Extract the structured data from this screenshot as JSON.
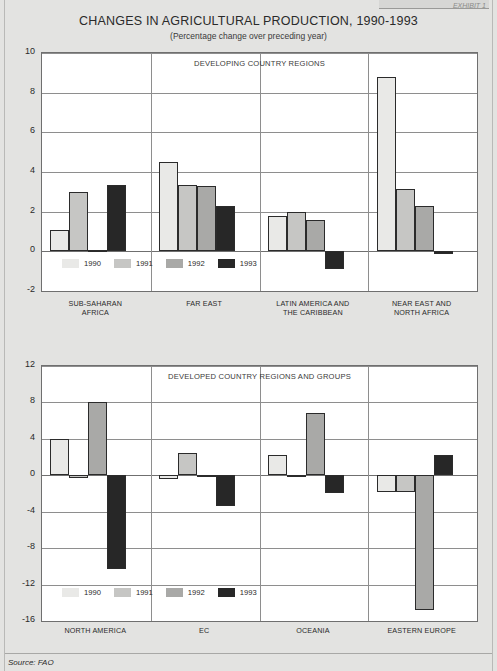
{
  "page": {
    "exhibit_tag": "EXHIBIT 1",
    "title": "CHANGES IN AGRICULTURAL PRODUCTION, 1990-1993",
    "subtitle": "(Percentage change over preceding year)",
    "source": "Source: FAO",
    "background_color": "#e3e3e1",
    "plot_background_color": "#ffffff"
  },
  "series_colors": {
    "1990": "#e9e9e7",
    "1991": "#c6c6c4",
    "1992": "#a9a9a7",
    "1993": "#272727"
  },
  "legend": {
    "items": [
      {
        "label": "1990",
        "color": "#e9e9e7"
      },
      {
        "label": "1991",
        "color": "#c6c6c4"
      },
      {
        "label": "1992",
        "color": "#a9a9a7"
      },
      {
        "label": "1993",
        "color": "#272727"
      }
    ]
  },
  "chart_data": [
    {
      "type": "bar",
      "title": "CHANGES IN AGRICULTURAL PRODUCTION, 1990-1993",
      "subtitle": "(Percentage change over preceding year)",
      "panel_caption": "DEVELOPING COUNTRY REGIONS",
      "xlabel": "",
      "ylabel": "",
      "ylim": [
        -2,
        10
      ],
      "yticks": [
        10,
        8,
        6,
        4,
        2,
        0,
        -2
      ],
      "ytick_labels": [
        "10",
        "8",
        "6",
        "4",
        "2",
        "0",
        "-2"
      ],
      "grid": true,
      "legend_position": "inside-bottom-left",
      "categories": [
        "SUB-SAHARAN AFRICA",
        "FAR EAST",
        "LATIN AMERICA AND THE CARIBBEAN",
        "NEAR EAST AND NORTH AFRICA"
      ],
      "category_lines": [
        [
          "SUB-SAHARAN",
          "AFRICA"
        ],
        [
          "FAR EAST"
        ],
        [
          "LATIN AMERICA AND",
          "THE CARIBBEAN"
        ],
        [
          "NEAR EAST AND",
          "NORTH AFRICA"
        ]
      ],
      "series": [
        {
          "name": "1990",
          "values": [
            1.1,
            4.5,
            1.8,
            8.8
          ]
        },
        {
          "name": "1991",
          "values": [
            3.0,
            3.35,
            2.0,
            3.15
          ]
        },
        {
          "name": "1992",
          "values": [
            0.05,
            3.3,
            1.6,
            2.3
          ]
        },
        {
          "name": "1993",
          "values": [
            3.35,
            2.3,
            -0.9,
            -0.15
          ]
        }
      ]
    },
    {
      "type": "bar",
      "panel_caption": "DEVELOPED COUNTRY REGIONS AND GROUPS",
      "xlabel": "",
      "ylabel": "",
      "ylim": [
        -16,
        12
      ],
      "yticks": [
        12,
        8,
        4,
        0,
        -4,
        -8,
        -12,
        -16
      ],
      "ytick_labels": [
        "12",
        "8",
        "4",
        "0",
        "-4",
        "-8",
        "-12",
        "-16"
      ],
      "grid": true,
      "legend_position": "inside-bottom-left",
      "categories": [
        "NORTH AMERICA",
        "EC",
        "OCEANIA",
        "EASTERN EUROPE"
      ],
      "category_lines": [
        [
          "NORTH AMERICA"
        ],
        [
          "EC"
        ],
        [
          "OCEANIA"
        ],
        [
          "EASTERN EUROPE"
        ]
      ],
      "series": [
        {
          "name": "1990",
          "values": [
            4.0,
            -0.4,
            2.2,
            -1.8
          ]
        },
        {
          "name": "1991",
          "values": [
            -0.3,
            2.4,
            -0.2,
            -1.8
          ]
        },
        {
          "name": "1992",
          "values": [
            8.0,
            -0.2,
            6.8,
            -14.8
          ]
        },
        {
          "name": "1993",
          "values": [
            -10.3,
            -3.4,
            -2.0,
            2.2
          ]
        }
      ]
    }
  ]
}
